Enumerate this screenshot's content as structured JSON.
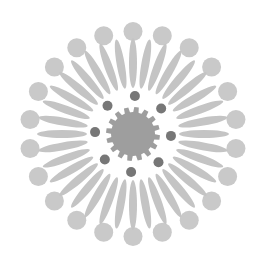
{
  "graphic": {
    "icon": "sunburst-emblem-icon",
    "center": [
      133,
      134
    ],
    "colors": {
      "background": "#ffffff",
      "outer_dots": "#c9c9c9",
      "petals": "#c4c4c4",
      "core": "#9e9e9e",
      "inner_dots": "#777777"
    },
    "outer_dots": {
      "count": 22,
      "radius": 104,
      "dot_radius": 9.5
    },
    "petals": {
      "count": 36,
      "inner_radius": 46,
      "outer_radius": 96,
      "width": 8
    },
    "inner_dots": {
      "count": 8,
      "radius": 38,
      "dot_radius": 5
    },
    "core": {
      "teeth": 16,
      "outer_radius": 27,
      "inner_radius": 21
    }
  }
}
